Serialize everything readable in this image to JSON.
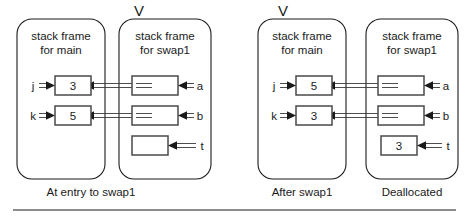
{
  "diagram": {
    "rule_color": "#1a1a1a",
    "line_color": "#3a3a3a",
    "box_color": "#4a4a4a",
    "v_marker": "V",
    "panels": [
      {
        "id": "panel-left",
        "caption": "At entry to swap1",
        "frames": [
          {
            "id": "left-main",
            "title_line1": "stack frame",
            "title_line2": "for   main",
            "has_v_marker": false,
            "cells": [
              {
                "id": "left-main-j",
                "label": "j",
                "value": "3",
                "kind": "value"
              },
              {
                "id": "left-main-k",
                "label": "k",
                "value": "5",
                "kind": "value"
              }
            ]
          },
          {
            "id": "left-swap1",
            "title_line1": "stack frame",
            "title_line2": "for   swap1",
            "has_v_marker": true,
            "cells": [
              {
                "id": "left-swap1-a",
                "label": "a",
                "value": "",
                "kind": "pointer"
              },
              {
                "id": "left-swap1-b",
                "label": "b",
                "value": "",
                "kind": "pointer"
              },
              {
                "id": "left-swap1-t",
                "label": "t",
                "value": "",
                "kind": "empty"
              }
            ]
          }
        ]
      },
      {
        "id": "panel-right",
        "caption_main": "After swap1",
        "caption_swap1": "Deallocated",
        "frames": [
          {
            "id": "right-main",
            "title_line1": "stack frame",
            "title_line2": "for   main",
            "has_v_marker": true,
            "cells": [
              {
                "id": "right-main-j",
                "label": "j",
                "value": "5",
                "kind": "value"
              },
              {
                "id": "right-main-k",
                "label": "k",
                "value": "3",
                "kind": "value"
              }
            ]
          },
          {
            "id": "right-swap1",
            "title_line1": "stack frame",
            "title_line2": "for   swap1",
            "has_v_marker": false,
            "cells": [
              {
                "id": "right-swap1-a",
                "label": "a",
                "value": "",
                "kind": "pointer"
              },
              {
                "id": "right-swap1-b",
                "label": "b",
                "value": "",
                "kind": "pointer"
              },
              {
                "id": "right-swap1-t",
                "label": "t",
                "value": "3",
                "kind": "value"
              }
            ]
          }
        ]
      }
    ]
  }
}
